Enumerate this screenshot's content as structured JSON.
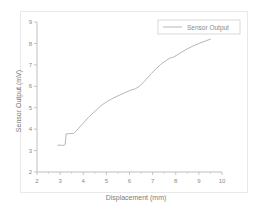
{
  "chart_data": {
    "type": "line",
    "title": "",
    "xlabel": "Displacement (mm)",
    "ylabel": "Sensor Output (mV)",
    "xlim": [
      2,
      10
    ],
    "ylim": [
      2,
      9
    ],
    "xticks": [
      2,
      3,
      4,
      5,
      6,
      7,
      8,
      9,
      10
    ],
    "yticks": [
      2,
      3,
      4,
      5,
      6,
      7,
      8,
      9
    ],
    "xtick_labels": [
      "2",
      "3",
      "4",
      "5",
      "6",
      "7",
      "8",
      "9",
      "10"
    ],
    "ytick_labels": [
      "2",
      "3",
      "4",
      "5",
      "6",
      "7",
      "8",
      "9"
    ],
    "minor_ticks_x": true,
    "minor_ticks_y": false,
    "grid": false,
    "legend_position": "upper right",
    "line_color": "#a9a9a9",
    "axis_color": "#b8b8b8",
    "background_color": "#ffffff",
    "series": [
      {
        "name": "Sensor Output",
        "x": [
          2.9,
          3.05,
          3.18,
          3.22,
          3.26,
          3.42,
          3.58,
          3.62,
          3.78,
          4.0,
          4.25,
          4.55,
          4.8,
          5.0,
          5.05,
          5.3,
          5.55,
          5.8,
          6.05,
          6.25,
          6.45,
          6.7,
          6.95,
          7.15,
          7.35,
          7.55,
          7.75,
          7.9,
          8.15,
          8.45,
          8.75,
          9.05,
          9.3,
          9.5
        ],
        "y": [
          3.25,
          3.25,
          3.24,
          3.3,
          3.78,
          3.79,
          3.8,
          3.84,
          4.02,
          4.28,
          4.58,
          4.88,
          5.12,
          5.27,
          5.3,
          5.45,
          5.58,
          5.7,
          5.82,
          5.88,
          6.02,
          6.3,
          6.6,
          6.82,
          7.02,
          7.18,
          7.32,
          7.36,
          7.52,
          7.72,
          7.88,
          8.02,
          8.12,
          8.2
        ]
      }
    ]
  },
  "legend": {
    "entries": [
      {
        "label": "Sensor Output"
      }
    ]
  }
}
